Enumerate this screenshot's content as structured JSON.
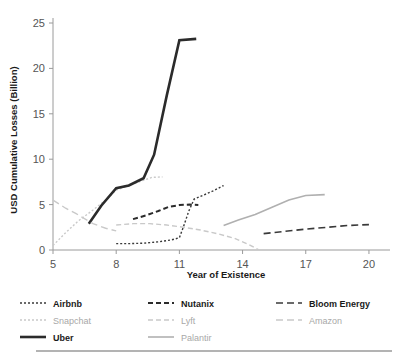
{
  "chart_data": {
    "type": "line",
    "title": "",
    "xlabel": "Year of Existence",
    "ylabel": "USD Cumulative Losses (Billion)",
    "xlim": [
      5,
      21
    ],
    "ylim": [
      0,
      25
    ],
    "xticks": [
      5,
      8,
      11,
      14,
      17,
      20
    ],
    "yticks": [
      0,
      5,
      10,
      15,
      20,
      25
    ],
    "xtick_labels": [
      "5",
      "8",
      "11",
      "14",
      "17",
      "20"
    ],
    "ytick_labels": [
      "0",
      "5",
      "10",
      "15",
      "20",
      "25"
    ],
    "grid": false,
    "legend_position": "below",
    "series": [
      {
        "name": "Airbnb",
        "color": "#3a3a3a",
        "dash": "2,2",
        "width": 1.4,
        "tone": "dark",
        "points": [
          [
            8.0,
            0.7
          ],
          [
            8.6,
            0.7
          ],
          [
            9.3,
            0.75
          ],
          [
            10.0,
            0.9
          ],
          [
            10.6,
            1.1
          ],
          [
            11.0,
            1.35
          ],
          [
            11.2,
            2.6
          ],
          [
            11.45,
            4.3
          ],
          [
            11.7,
            5.6
          ],
          [
            12.1,
            6.0
          ],
          [
            12.6,
            6.5
          ],
          [
            13.1,
            7.1
          ]
        ]
      },
      {
        "name": "Snapchat",
        "color": "#c9c9c9",
        "dash": "2,2",
        "width": 1.4,
        "tone": "light",
        "points": [
          [
            5.0,
            0.5
          ],
          [
            5.6,
            1.9
          ],
          [
            6.2,
            3.2
          ],
          [
            6.9,
            4.4
          ],
          [
            7.6,
            5.7
          ],
          [
            8.0,
            6.6
          ],
          [
            8.6,
            7.1
          ],
          [
            9.2,
            7.6
          ],
          [
            9.7,
            8.0
          ],
          [
            10.2,
            8.05
          ]
        ]
      },
      {
        "name": "Uber",
        "color": "#2b2b2b",
        "dash": "none",
        "width": 2.6,
        "tone": "dark",
        "points": [
          [
            6.7,
            2.9
          ],
          [
            7.3,
            4.9
          ],
          [
            8.0,
            6.8
          ],
          [
            8.6,
            7.1
          ],
          [
            9.3,
            7.9
          ],
          [
            9.8,
            10.5
          ],
          [
            10.4,
            17.0
          ],
          [
            11.0,
            23.1
          ],
          [
            11.8,
            23.25
          ]
        ]
      },
      {
        "name": "Nutanix",
        "color": "#2b2b2b",
        "dash": "5,3",
        "width": 2.0,
        "tone": "dark",
        "points": [
          [
            8.8,
            3.4
          ],
          [
            9.4,
            3.8
          ],
          [
            10.0,
            4.3
          ],
          [
            10.5,
            4.75
          ],
          [
            11.0,
            4.95
          ],
          [
            11.5,
            5.0
          ],
          [
            11.9,
            4.95
          ]
        ]
      },
      {
        "name": "Lyft",
        "color": "#c9c9c9",
        "dash": "5,3",
        "width": 1.4,
        "tone": "light",
        "points": [
          [
            8.0,
            2.75
          ],
          [
            8.8,
            2.9
          ],
          [
            9.6,
            2.9
          ],
          [
            10.4,
            2.75
          ],
          [
            11.2,
            2.5
          ],
          [
            12.0,
            2.2
          ],
          [
            12.8,
            1.8
          ],
          [
            13.6,
            1.3
          ],
          [
            14.3,
            0.6
          ],
          [
            14.75,
            0.05
          ]
        ]
      },
      {
        "name": "Palantir",
        "color": "#b0b0b0",
        "dash": "none",
        "width": 1.6,
        "tone": "light",
        "points": [
          [
            13.1,
            2.7
          ],
          [
            13.8,
            3.3
          ],
          [
            14.6,
            3.9
          ],
          [
            15.4,
            4.7
          ],
          [
            16.2,
            5.5
          ],
          [
            17.0,
            6.0
          ],
          [
            17.9,
            6.1
          ]
        ]
      },
      {
        "name": "Bloom Energy",
        "color": "#3a3a3a",
        "dash": "7,4",
        "width": 1.6,
        "tone": "dark",
        "points": [
          [
            15.0,
            1.8
          ],
          [
            16.0,
            2.05
          ],
          [
            17.0,
            2.3
          ],
          [
            18.0,
            2.5
          ],
          [
            19.0,
            2.7
          ],
          [
            20.0,
            2.8
          ]
        ]
      },
      {
        "name": "Amazon",
        "color": "#c9c9c9",
        "dash": "7,4",
        "width": 1.4,
        "tone": "light",
        "points": [
          [
            5.0,
            5.5
          ],
          [
            5.6,
            4.6
          ],
          [
            6.1,
            4.0
          ],
          [
            6.9,
            2.9
          ],
          [
            7.5,
            2.4
          ],
          [
            8.0,
            2.1
          ],
          [
            8.0,
            2.1
          ]
        ]
      }
    ]
  },
  "legend": {
    "columns": [
      {
        "entries": [
          {
            "label": "Airbnb",
            "series": "Airbnb"
          },
          {
            "label": "Snapchat",
            "series": "Snapchat"
          },
          {
            "label": "Uber",
            "series": "Uber"
          }
        ]
      },
      {
        "entries": [
          {
            "label": "Nutanix",
            "series": "Nutanix"
          },
          {
            "label": "Lyft",
            "series": "Lyft"
          },
          {
            "label": "Palantir",
            "series": "Palantir"
          }
        ]
      },
      {
        "entries": [
          {
            "label": "Bloom Energy",
            "series": "Bloom Energy"
          },
          {
            "label": "Amazon",
            "series": "Amazon"
          }
        ]
      }
    ]
  }
}
